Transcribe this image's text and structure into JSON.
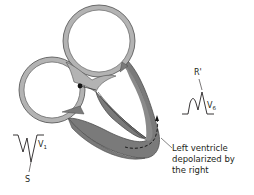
{
  "diagram": {
    "colors": {
      "atria_wall": "#b3b3b3",
      "ventricle_wall": "#7a7a7a",
      "outline": "#4d4d4d",
      "text": "#231f20",
      "background": "#ffffff"
    },
    "labels": {
      "v6_lead": "V",
      "v6_sub": "6",
      "r_prime": "R'",
      "v1_lead": "V",
      "v1_sub": "1",
      "s_wave": "S",
      "annotation_line1": "Left ventricle",
      "annotation_line2": "depolarized by",
      "annotation_line3": "the right"
    },
    "icons": {
      "sa_node": "filled-circle",
      "conduction_arrow": "dashed-arrow"
    }
  }
}
